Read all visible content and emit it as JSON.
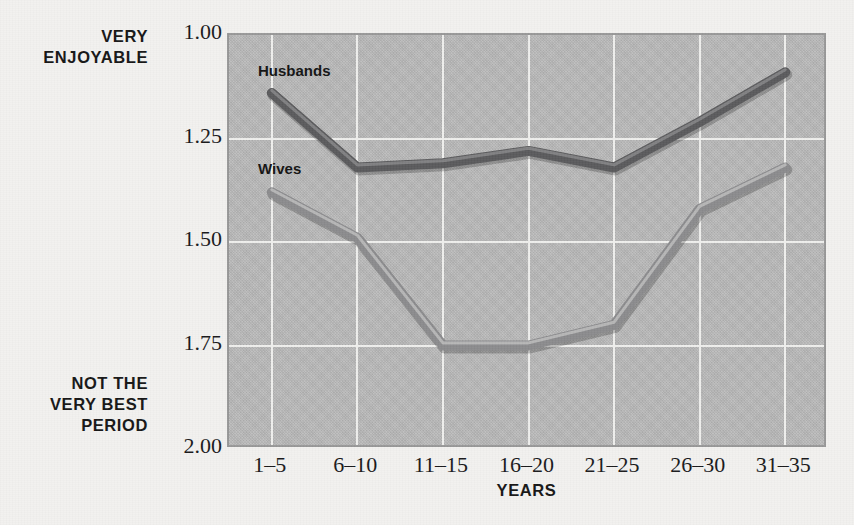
{
  "figure": {
    "y_axis_top_label": "VERY\nENJOYABLE",
    "y_axis_bottom_label": "NOT THE\nVERY BEST\nPERIOD",
    "x_axis_title": "YEARS"
  },
  "colors": {
    "page_background": "#f2f1ef",
    "plot_background": "#b9b9b9",
    "plot_border": "#989898",
    "gridline": "#efefed",
    "husbands_line": "#5a5a5c",
    "husbands_highlight": "#8d8d8f",
    "wives_line": "#8b8b8d",
    "wives_highlight": "#c4c4c4",
    "text": "#18181a"
  },
  "chart_data": {
    "type": "line",
    "title": "",
    "subtitle": "",
    "xlabel": "YEARS",
    "ylabel": "",
    "categories": [
      "1–5",
      "6–10",
      "11–15",
      "16–20",
      "21–25",
      "26–30",
      "31–35"
    ],
    "ytick_labels": [
      "1.00",
      "1.25",
      "1.50",
      "1.75",
      "2.00"
    ],
    "ytick_values": [
      1.0,
      1.25,
      1.5,
      1.75,
      2.0
    ],
    "ylim": [
      1.0,
      2.0
    ],
    "y_inverted": true,
    "grid": true,
    "legend": "inline-labels",
    "annotations": [
      {
        "text": "VERY ENJOYABLE",
        "position": "y-axis-top"
      },
      {
        "text": "NOT THE VERY BEST PERIOD",
        "position": "y-axis-bottom"
      }
    ],
    "series": [
      {
        "name": "Husbands",
        "color": "#5a5a5c",
        "values": [
          1.14,
          1.32,
          1.31,
          1.28,
          1.32,
          1.21,
          1.09
        ]
      },
      {
        "name": "Wives",
        "color": "#8b8b8d",
        "values": [
          1.38,
          1.49,
          1.75,
          1.75,
          1.7,
          1.42,
          1.32
        ]
      }
    ]
  }
}
